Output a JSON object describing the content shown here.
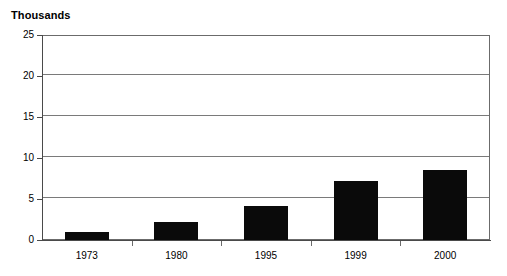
{
  "chart_data": {
    "type": "bar",
    "title": "Thousands",
    "xlabel": "",
    "ylabel": "Thousands",
    "categories": [
      "1973",
      "1980",
      "1995",
      "1999",
      "2000"
    ],
    "values": [
      1.0,
      2.2,
      4.2,
      7.2,
      8.5
    ],
    "series": [
      {
        "name": "Thousands",
        "values": [
          1.0,
          2.2,
          4.2,
          7.2,
          8.5
        ]
      }
    ],
    "ylim": [
      0,
      25
    ],
    "yticks": [
      0,
      5,
      10,
      15,
      20,
      25
    ],
    "ytick_labels": [
      "0",
      "5",
      "10",
      "15",
      "20",
      "25"
    ],
    "grid": true,
    "grid_axis": "y",
    "legend": false,
    "legend_position": "none",
    "bar_color": "#0a0a0a",
    "frame_color": "#6b6b6b",
    "grid_color": "#7a7a7a",
    "background": "#ffffff"
  }
}
